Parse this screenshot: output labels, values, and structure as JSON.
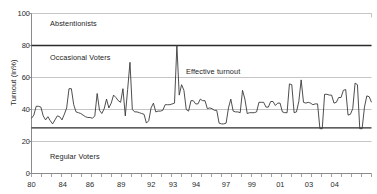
{
  "chart_data": {
    "type": "line",
    "title": "",
    "subtitle": "",
    "xlabel": "",
    "ylabel": "Turnout (in%)",
    "ylim": [
      0,
      100
    ],
    "yticks": [
      0,
      20,
      40,
      60,
      80,
      100
    ],
    "ytick_labels": [
      "0",
      "20",
      "40",
      "60",
      "80",
      "100"
    ],
    "xlim": [
      1980,
      2005
    ],
    "xtick_labels": [
      "80",
      "84",
      "86",
      "89",
      "92",
      "93",
      "94",
      "97",
      "99",
      "01",
      "03",
      "04"
    ],
    "xtick_positions": [
      1980.0,
      1982.3,
      1984.3,
      1986.6,
      1988.8,
      1990.4,
      1992.1,
      1994.3,
      1996.2,
      1998.3,
      2000.4,
      2002.3
    ],
    "grid": true,
    "grid_axis": "y",
    "legend": "none",
    "series": [
      {
        "name": "Effective turnout",
        "color": "#3a3a3a",
        "values": [
          34.5,
          36.5,
          42.0,
          42.0,
          41.5,
          36.0,
          33.5,
          35.5,
          33.0,
          31.0,
          33.5,
          36.0,
          35.5,
          33.5,
          37.0,
          41.0,
          53.0,
          53.0,
          43.0,
          38.5,
          38.0,
          37.5,
          36.5,
          35.5,
          35.0,
          35.0,
          34.5,
          36.0,
          50.0,
          39.5,
          37.5,
          40.5,
          46.5,
          41.0,
          44.0,
          49.0,
          47.5,
          45.5,
          44.5,
          53.0,
          36.0,
          52.5,
          69.5,
          40.0,
          38.5,
          38.5,
          38.0,
          37.5,
          37.0,
          31.5,
          33.0,
          41.0,
          44.0,
          38.5,
          39.0,
          39.0,
          39.5,
          43.0,
          43.0,
          43.0,
          43.5,
          44.0,
          80.0,
          49.0,
          55.5,
          52.0,
          40.0,
          39.0,
          45.5,
          45.5,
          43.5,
          43.5,
          46.5,
          45.5,
          45.5,
          40.5,
          41.0,
          40.5,
          39.5,
          39.5,
          31.5,
          31.0,
          31.0,
          31.5,
          41.0,
          46.5,
          39.0,
          38.5,
          38.5,
          38.0,
          52.0,
          46.5,
          37.5,
          38.0,
          38.0,
          38.0,
          38.5,
          44.5,
          44.5,
          44.5,
          41.5,
          41.5,
          45.0,
          45.0,
          42.5,
          44.0,
          44.0,
          38.5,
          38.0,
          38.0,
          56.0,
          55.5,
          38.0,
          38.5,
          45.0,
          58.5,
          44.5,
          44.0,
          44.5,
          44.0,
          43.0,
          43.5,
          43.5,
          28.0,
          28.0,
          49.5,
          49.5,
          49.0,
          49.0,
          44.0,
          44.5,
          47.5,
          47.5,
          52.0,
          52.5,
          36.5,
          37.0,
          40.5,
          56.5,
          55.5,
          28.0,
          28.0,
          41.5,
          48.5,
          48.0,
          44.5
        ]
      }
    ],
    "reference_lines": [
      {
        "name": "upper-threshold",
        "value": 80,
        "color": "#2b2b2b",
        "width": 1.4
      },
      {
        "name": "lower-threshold",
        "value": 28.5,
        "color": "#2b2b2b",
        "width": 1.4
      }
    ],
    "annotations": [
      {
        "name": "abstentionists",
        "text": "Abstentionists",
        "x_px": 50,
        "y_px": 19
      },
      {
        "name": "occasional-voters",
        "text": "Occasional Voters",
        "x_px": 50,
        "y_px": 53
      },
      {
        "name": "effective-turnout",
        "text": "Effective turnout",
        "x_px": 186,
        "y_px": 67
      },
      {
        "name": "regular-voters",
        "text": "Regular Voters",
        "x_px": 50,
        "y_px": 152
      }
    ]
  }
}
